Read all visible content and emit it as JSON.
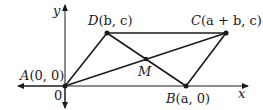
{
  "diagram": {
    "axes": {
      "x_label": "x",
      "y_label": "y",
      "origin_label": "0"
    },
    "points": [
      {
        "id": "A",
        "label": "A(0, 0)",
        "name": "A",
        "coords": "(0, 0)"
      },
      {
        "id": "B",
        "label": "B(a, 0)",
        "name": "B",
        "coords": "(a, 0)"
      },
      {
        "id": "C",
        "label": "C(a + b, c)",
        "name": "C",
        "coords": "(a + b, c)"
      },
      {
        "id": "D",
        "label": "D(b, c)",
        "name": "D",
        "coords": "(b, c)"
      },
      {
        "id": "M",
        "label": "M",
        "name": "M",
        "coords": ""
      }
    ],
    "segments": [
      "AB",
      "BC",
      "CD",
      "DA",
      "AC",
      "BD"
    ],
    "colors": {
      "stroke": "#1a1a1a",
      "background": "#ffffff"
    }
  }
}
